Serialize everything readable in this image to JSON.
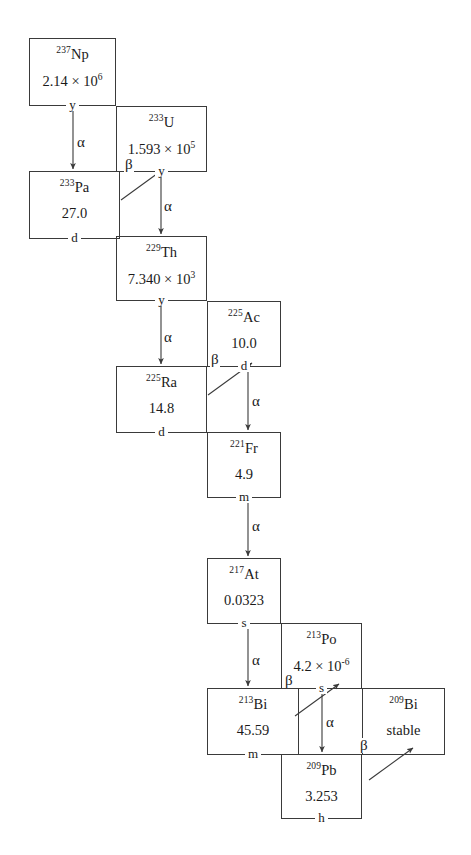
{
  "diagram": {
    "background_color": "#ffffff",
    "line_color": "#3a3a3a"
  },
  "nuclides": [
    {
      "id": "np237",
      "mass": "237",
      "element": "Np",
      "value": "2.14",
      "mantissa_sep": " × 10",
      "exponent": "6",
      "unit": "y",
      "x": 29,
      "y": 38,
      "w": 87,
      "h": 68
    },
    {
      "id": "u233",
      "mass": "233",
      "element": "U",
      "value": "1.593",
      "mantissa_sep": " × 10",
      "exponent": "5",
      "unit": "y",
      "x": 116,
      "y": 106,
      "w": 91,
      "h": 66
    },
    {
      "id": "pa233",
      "mass": "233",
      "element": "Pa",
      "value": "27.0",
      "mantissa_sep": "",
      "exponent": "",
      "unit": "d",
      "x": 29,
      "y": 171,
      "w": 91,
      "h": 68
    },
    {
      "id": "th229",
      "mass": "229",
      "element": "Th",
      "value": "7.340",
      "mantissa_sep": " × 10",
      "exponent": "3",
      "unit": "y",
      "x": 116,
      "y": 236,
      "w": 91,
      "h": 65
    },
    {
      "id": "ac225",
      "mass": "225",
      "element": "Ac",
      "value": "10.0",
      "mantissa_sep": "",
      "exponent": "",
      "unit": "d",
      "x": 207,
      "y": 301,
      "w": 74,
      "h": 66
    },
    {
      "id": "ra225",
      "mass": "225",
      "element": "Ra",
      "value": "14.8",
      "mantissa_sep": "",
      "exponent": "",
      "unit": "d",
      "x": 116,
      "y": 366,
      "w": 91,
      "h": 67
    },
    {
      "id": "fr221",
      "mass": "221",
      "element": "Fr",
      "value": "4.9",
      "mantissa_sep": "",
      "exponent": "",
      "unit": "m",
      "x": 207,
      "y": 432,
      "w": 74,
      "h": 66
    },
    {
      "id": "at217",
      "mass": "217",
      "element": "At",
      "value": "0.0323",
      "mantissa_sep": "",
      "exponent": "",
      "unit": "s",
      "x": 207,
      "y": 558,
      "w": 74,
      "h": 66
    },
    {
      "id": "po213",
      "mass": "213",
      "element": "Po",
      "value": "4.2",
      "mantissa_sep": " × 10",
      "exponent": "-6",
      "unit": "s",
      "x": 281,
      "y": 623,
      "w": 81,
      "h": 66
    },
    {
      "id": "bi213",
      "mass": "213",
      "element": "Bi",
      "value": "45.59",
      "mantissa_sep": "",
      "exponent": "",
      "unit": "m",
      "x": 207,
      "y": 688,
      "w": 92,
      "h": 67
    },
    {
      "id": "pb209",
      "mass": "209",
      "element": "Pb",
      "value": "3.253",
      "mantissa_sep": "",
      "exponent": "",
      "unit": "h",
      "x": 281,
      "y": 754,
      "w": 81,
      "h": 65
    },
    {
      "id": "bi209",
      "mass": "209",
      "element": "Bi",
      "value": "stable",
      "mantissa_sep": "",
      "exponent": "",
      "unit": "",
      "x": 362,
      "y": 688,
      "w": 83,
      "h": 67
    }
  ],
  "decays": [
    {
      "id": "np237-to-pa233",
      "type": "alpha",
      "symbol": "α",
      "from": "np237",
      "to": "pa233",
      "label_x": 76,
      "label_y": 135
    },
    {
      "id": "u233-to-pa233",
      "type": "beta",
      "symbol": "β",
      "from": "u233",
      "to": "pa233",
      "label_x": 124,
      "label_y": 157
    },
    {
      "id": "u233-to-th229",
      "type": "alpha",
      "symbol": "α",
      "from": "u233",
      "to": "th229",
      "label_x": 163,
      "label_y": 199
    },
    {
      "id": "th229-to-ra225",
      "type": "alpha",
      "symbol": "α",
      "from": "th229",
      "to": "ra225",
      "label_x": 163,
      "label_y": 330
    },
    {
      "id": "ac225-to-ra225",
      "type": "beta",
      "symbol": "β",
      "from": "ac225",
      "to": "ra225",
      "label_x": 210,
      "label_y": 352
    },
    {
      "id": "ac225-to-fr221",
      "type": "alpha",
      "symbol": "α",
      "from": "ac225",
      "to": "fr221",
      "label_x": 251,
      "label_y": 394
    },
    {
      "id": "fr221-to-at217",
      "type": "alpha",
      "symbol": "α",
      "from": "fr221",
      "to": "at217",
      "label_x": 251,
      "label_y": 519
    },
    {
      "id": "at217-to-bi213",
      "type": "alpha",
      "symbol": "α",
      "from": "at217",
      "to": "bi213",
      "label_x": 251,
      "label_y": 653
    },
    {
      "id": "po213-to-bi213",
      "type": "beta",
      "symbol": "β",
      "from": "po213",
      "to": "bi213",
      "label_x": 284,
      "label_y": 673
    },
    {
      "id": "po213-to-pb209",
      "type": "alpha",
      "symbol": "α",
      "from": "po213",
      "to": "pb209",
      "label_x": 325,
      "label_y": 715
    },
    {
      "id": "pb209-to-bi209",
      "type": "beta",
      "symbol": "β",
      "from": "pb209",
      "to": "bi209",
      "label_x": 359,
      "label_y": 738
    }
  ],
  "arrow_paths": {
    "np237-to-pa233": {
      "x1": 73,
      "y1": 106,
      "x2": 73,
      "y2": 169
    },
    "u233-to-pa233": {
      "x1": 121,
      "y1": 200,
      "x2": 165,
      "y2": 168
    },
    "u233-to-th229": {
      "x1": 161,
      "y1": 172,
      "x2": 161,
      "y2": 234
    },
    "th229-to-ra225": {
      "x1": 161,
      "y1": 301,
      "x2": 161,
      "y2": 364
    },
    "ac225-to-ra225": {
      "x1": 208,
      "y1": 395,
      "x2": 252,
      "y2": 363
    },
    "ac225-to-fr221": {
      "x1": 248,
      "y1": 367,
      "x2": 248,
      "y2": 430
    },
    "fr221-to-at217": {
      "x1": 248,
      "y1": 498,
      "x2": 248,
      "y2": 556
    },
    "at217-to-bi213": {
      "x1": 248,
      "y1": 624,
      "x2": 248,
      "y2": 686
    },
    "po213-to-bi213": {
      "x1": 295,
      "y1": 716,
      "x2": 339,
      "y2": 684
    },
    "po213-to-pb209": {
      "x1": 322,
      "y1": 689,
      "x2": 322,
      "y2": 752
    },
    "pb209-to-bi209": {
      "x1": 369,
      "y1": 780,
      "x2": 413,
      "y2": 748
    }
  }
}
